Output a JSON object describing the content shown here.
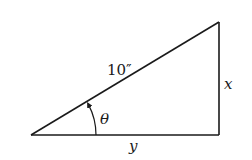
{
  "diagram": {
    "type": "right-triangle",
    "hypotenuse_label": "10″",
    "vertical_side_label": "x",
    "horizontal_side_label": "y",
    "angle_label": "θ",
    "stroke_color": "#1a1a1a",
    "background_color": "#ffffff"
  }
}
